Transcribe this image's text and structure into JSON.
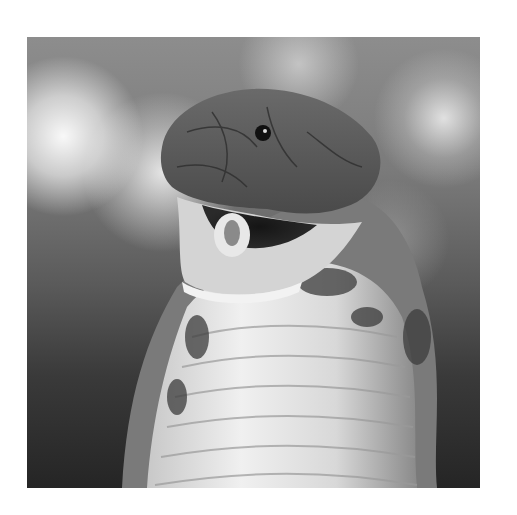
{
  "image": {
    "subject": "cobra with open mouth",
    "style": "grayscale photograph",
    "alt": "Grayscale close-up photo of a cobra rearing up with its mouth open against a blurred bokeh background"
  }
}
